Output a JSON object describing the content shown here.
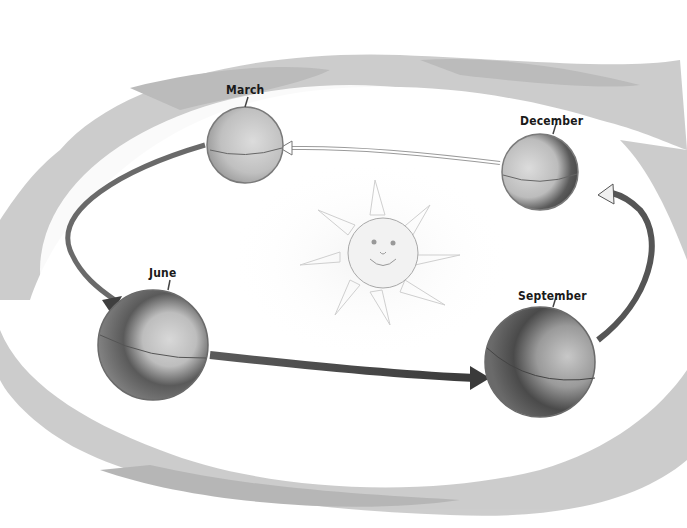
{
  "diagram": {
    "center": {
      "name": "sun",
      "description": "smiling sun face with rays"
    },
    "positions": [
      {
        "id": "march",
        "label": "March"
      },
      {
        "id": "june",
        "label": "June"
      },
      {
        "id": "september",
        "label": "September"
      },
      {
        "id": "december",
        "label": "December"
      }
    ],
    "orbit_direction": "counter-clockwise (March → June → September → December → March)",
    "colors": {
      "clouds": "#bdbdbd",
      "background": "#ffffff",
      "globe_light": "#c8c8c8",
      "globe_dark": "#3a3a3a",
      "arrow": "#4a4a4a"
    }
  }
}
